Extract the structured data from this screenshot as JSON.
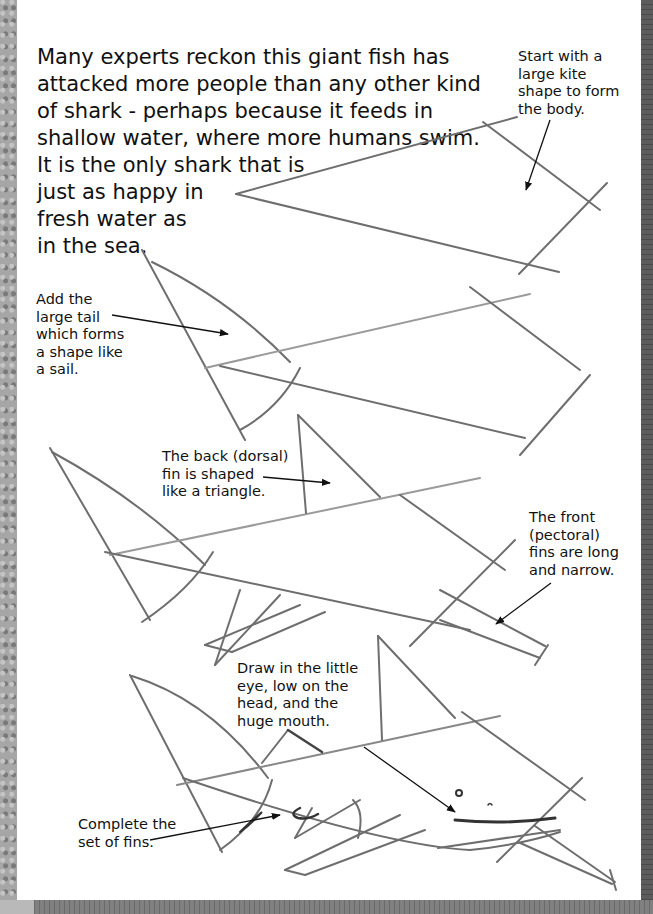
{
  "intro": {
    "lines": [
      "Many experts reckon this giant fish has",
      "attacked more people than any other kind",
      "of shark - perhaps because it feeds in",
      "shallow water, where more humans swim.",
      "It is the only shark that is",
      "just as happy in",
      "fresh water as",
      "in the sea."
    ]
  },
  "steps": [
    {
      "id": "step-1-body",
      "lines": [
        "Start with a",
        "large kite",
        "shape to form",
        "the body."
      ]
    },
    {
      "id": "step-2-tail",
      "lines": [
        "Add the",
        "large tail",
        "which forms",
        "a shape like",
        "a sail."
      ]
    },
    {
      "id": "step-3-dorsal-fin",
      "lines": [
        "The back (dorsal)",
        "fin is shaped",
        "like a triangle."
      ]
    },
    {
      "id": "step-3-pectoral-fins",
      "lines": [
        "The front",
        "(pectoral)",
        "fins are long",
        "and narrow."
      ]
    },
    {
      "id": "step-4-eye-mouth",
      "lines": [
        "Draw in the little",
        "eye, low on the",
        "head, and the",
        "huge mouth."
      ]
    },
    {
      "id": "step-4-fins",
      "lines": [
        "Complete the",
        "set of fins."
      ]
    }
  ],
  "colors": {
    "pencil": "#6e6e6e",
    "pencil_light": "#9a9a9a",
    "ink": "#111111",
    "page": "#ffffff"
  }
}
